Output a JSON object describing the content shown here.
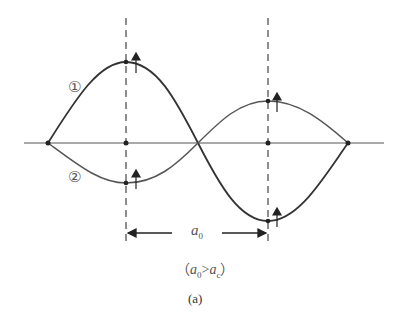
{
  "figure": {
    "caption": "(a)",
    "curve_labels": [
      "①",
      "②"
    ],
    "dimension_label": {
      "symbol": "a",
      "subscript": "0"
    },
    "condition": {
      "open": "（",
      "lhs": "a",
      "lhs_sub": "0",
      "op": ">",
      "rhs": "a",
      "rhs_sub": "c",
      "close": "）"
    }
  },
  "colors": {
    "line": "#333333",
    "axis": "#555555",
    "dash": "#444444"
  }
}
